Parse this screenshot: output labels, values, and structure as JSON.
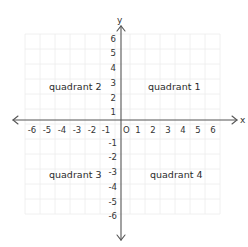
{
  "diagram": {
    "type": "coordinate-plane",
    "x_axis_label": "x",
    "y_axis_label": "y",
    "origin_label": "O",
    "x_ticks": [
      "-6",
      "-5",
      "-4",
      "-3",
      "-2",
      "-1",
      "1",
      "2",
      "3",
      "4",
      "5",
      "6"
    ],
    "y_ticks_positive": [
      "6",
      "5",
      "4",
      "3",
      "2",
      "1"
    ],
    "y_ticks_negative": [
      "-1",
      "-2",
      "-3",
      "-4",
      "-5",
      "-6"
    ],
    "quadrants": {
      "q1": "quadrant 1",
      "q2": "quadrant 2",
      "q3": "quadrant 3",
      "q4": "quadrant 4"
    },
    "range": {
      "x": [
        -6,
        6
      ],
      "y": [
        -6,
        6
      ]
    },
    "colors": {
      "grid": "#ececec",
      "axis": "#555555",
      "text": "#333333"
    }
  }
}
